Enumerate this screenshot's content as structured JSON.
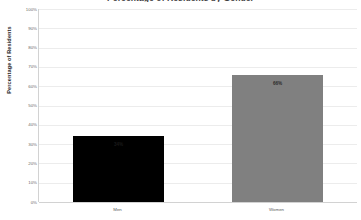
{
  "chart_data": {
    "type": "bar",
    "title": "Percentage of Residents by Gender",
    "xlabel": "",
    "ylabel": "Percentage of Residents",
    "categories": [
      "Men",
      "Women"
    ],
    "values": [
      34,
      66
    ],
    "value_labels": [
      "34%",
      "66%"
    ],
    "colors": [
      "#000000",
      "#808080"
    ],
    "ylim": [
      0,
      100
    ],
    "ytick_labels": [
      "0%",
      "10%",
      "20%",
      "30%",
      "40%",
      "50%",
      "60%",
      "70%",
      "80%",
      "90%",
      "100%"
    ],
    "ytick_values": [
      0,
      10,
      20,
      30,
      40,
      50,
      60,
      70,
      80,
      90,
      100
    ],
    "grid": true,
    "legend": false,
    "legend_position": "none"
  }
}
